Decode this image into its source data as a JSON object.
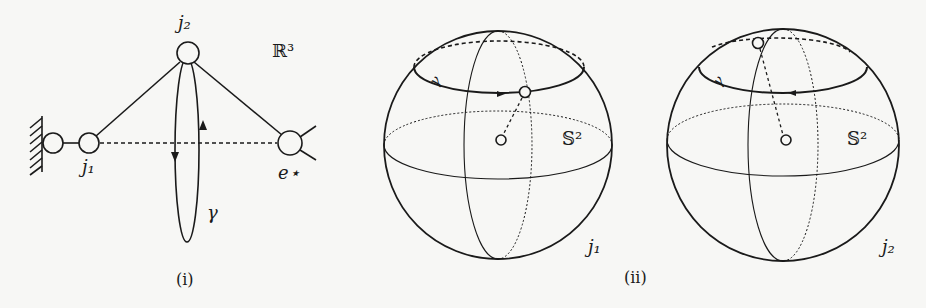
{
  "figure": {
    "panels": [
      {
        "id": "i",
        "caption": "(i)",
        "labels": {
          "j2": "j₂",
          "space": "ℝ³",
          "j1": "j₁",
          "e_star": "e⋆",
          "gamma": "γ"
        }
      },
      {
        "id": "ii",
        "caption": "(ii)",
        "spheres": [
          {
            "name": "sphere-j1",
            "sphere_label": "𝕊²",
            "joint_label": "j₁",
            "gamma": "γ"
          },
          {
            "name": "sphere-j2",
            "sphere_label": "𝕊²",
            "joint_label": "j₂",
            "gamma": "γ"
          }
        ]
      }
    ],
    "colors": {
      "stroke": "#1a1a1a",
      "background": "#f7f7f5"
    }
  }
}
